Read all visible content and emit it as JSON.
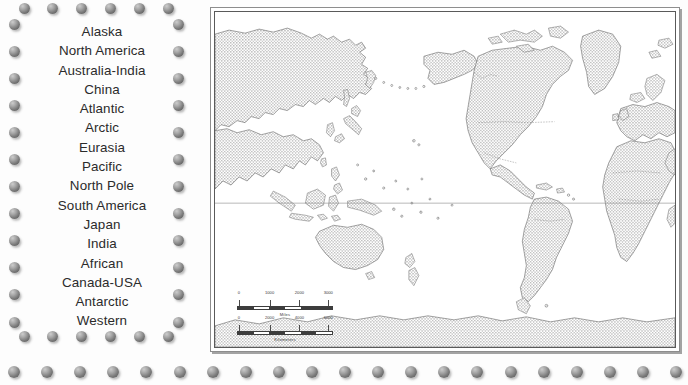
{
  "regions": {
    "label": "Region name list",
    "items": [
      "Alaska",
      "North America",
      "Australia-India",
      "China",
      "Atlantic",
      "Arctic",
      "Eurasia",
      "Pacific",
      "North Pole",
      "South America",
      "Japan",
      "India",
      "African",
      "Canada-USA",
      "Antarctic",
      "Western"
    ]
  },
  "decoration": {
    "bead_icon": "sphere-bead-icon",
    "border_bead_count": 38,
    "bottom_row_bead_count": 21
  },
  "map": {
    "title": "World map",
    "projection_note": "Pacific-centered world map",
    "equator_label": "equator-line",
    "colors": {
      "land_fill": "#d4d4d4",
      "land_outline": "#5d5d5d",
      "ocean": "#ffffff",
      "frame": "#5a5a5a",
      "text": "#3a3a3a"
    },
    "scalebars": [
      {
        "unit_caption": "Miles",
        "tick_labels": [
          "0",
          "1000",
          "2000",
          "3000"
        ],
        "max_value": 3000
      },
      {
        "unit_caption": "Kilometers",
        "tick_labels": [
          "0",
          "2000",
          "4000",
          "6000"
        ],
        "max_value": 6000
      }
    ]
  }
}
